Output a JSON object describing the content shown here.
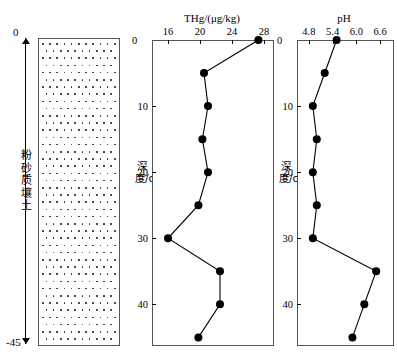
{
  "figure": {
    "soil_column": {
      "label": "粉砂质壤土",
      "top_depth_label": "0",
      "bottom_depth_label": "-45",
      "pattern": "silt-dots"
    },
    "panels": [
      {
        "tag": "(a)",
        "axis_title": "THg/(μg/kg)",
        "y_axis_label": "深度/cm",
        "zero_label": "0"
      },
      {
        "tag": "(b)",
        "axis_title": "pH",
        "y_axis_label": "深度/cm",
        "zero_label": "0"
      }
    ]
  },
  "chart_data": [
    {
      "type": "line",
      "title": "THg/(μg/kg)",
      "panel_tag": "(a)",
      "xlabel": "THg/(μg/kg)",
      "ylabel": "深度/cm",
      "xlim": [
        14,
        29
      ],
      "ylim": [
        0,
        46
      ],
      "y_inverted": true,
      "xticks": [
        16,
        20,
        24,
        28
      ],
      "xtick_labels": [
        "16",
        "20",
        "24",
        "28"
      ],
      "yticks": [
        0,
        10,
        20,
        30,
        40
      ],
      "ytick_labels": [
        "0",
        "10",
        "20",
        "30",
        "40"
      ],
      "grid": false,
      "legend": false,
      "marker": "filled-circle",
      "x": [
        27.3,
        20.5,
        21.0,
        20.3,
        21.0,
        19.8,
        16.0,
        22.5,
        22.5,
        19.8
      ],
      "y": [
        0,
        5,
        10,
        15,
        20,
        25,
        30,
        35,
        40,
        45
      ],
      "series": [
        {
          "name": "THg",
          "depths_cm": [
            0,
            5,
            10,
            15,
            20,
            25,
            30,
            35,
            40,
            45
          ],
          "values": [
            27.3,
            20.5,
            21.0,
            20.3,
            21.0,
            19.8,
            16.0,
            22.5,
            22.5,
            19.8
          ]
        }
      ]
    },
    {
      "type": "line",
      "title": "pH",
      "panel_tag": "(b)",
      "xlabel": "pH",
      "ylabel": "深度/cm",
      "xlim": [
        4.5,
        6.9
      ],
      "ylim": [
        0,
        46
      ],
      "y_inverted": true,
      "xticks": [
        4.8,
        5.4,
        6.0,
        6.6
      ],
      "xtick_labels": [
        "4.8",
        "5.4",
        "6.0",
        "6.6"
      ],
      "yticks": [
        0,
        10,
        20,
        30,
        40
      ],
      "ytick_labels": [
        "0",
        "10",
        "20",
        "30",
        "40"
      ],
      "grid": false,
      "legend": false,
      "marker": "filled-circle",
      "x": [
        5.5,
        5.2,
        4.9,
        5.0,
        4.9,
        5.0,
        4.9,
        6.5,
        6.2,
        5.9
      ],
      "y": [
        0,
        5,
        10,
        15,
        20,
        25,
        30,
        35,
        40,
        45
      ],
      "series": [
        {
          "name": "pH",
          "depths_cm": [
            0,
            5,
            10,
            15,
            20,
            25,
            30,
            35,
            40,
            45
          ],
          "values": [
            5.5,
            5.2,
            4.9,
            5.0,
            4.9,
            5.0,
            4.9,
            6.5,
            6.2,
            5.9
          ]
        }
      ]
    }
  ],
  "colors": {
    "line": "#000000",
    "marker": "#000000",
    "frame": "#555555",
    "background": "#ffffff"
  }
}
